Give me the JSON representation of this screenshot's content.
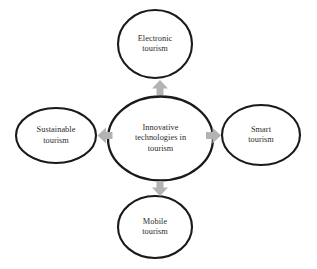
{
  "diagram": {
    "type": "hub-and-spoke",
    "background_color": "#ffffff",
    "node_stroke_color": "#1a1a1a",
    "node_fill_color": "#ffffff",
    "arrow_color": "#b3b3b3",
    "text_color": "#2b2b2b",
    "center": {
      "id": "innovative-technologies-in-tourism",
      "label": "Innovative\ntechnologies in\ntourism"
    },
    "nodes": [
      {
        "id": "electronic-tourism",
        "label": "Electronic\ntourism",
        "position": "top"
      },
      {
        "id": "smart-tourism",
        "label": "Smart\ntourism",
        "position": "right"
      },
      {
        "id": "mobile-tourism",
        "label": "Mobile\ntourism",
        "position": "bottom"
      },
      {
        "id": "sustainable-tourism",
        "label": "Sustainable\ntourism",
        "position": "left"
      }
    ],
    "connectors": [
      {
        "id": "arrow-up",
        "direction": "up",
        "from": "center",
        "to": "electronic-tourism"
      },
      {
        "id": "arrow-right",
        "direction": "right",
        "from": "center",
        "to": "smart-tourism"
      },
      {
        "id": "arrow-down",
        "direction": "down",
        "from": "center",
        "to": "mobile-tourism"
      },
      {
        "id": "arrow-left",
        "direction": "left",
        "from": "center",
        "to": "sustainable-tourism"
      }
    ]
  }
}
